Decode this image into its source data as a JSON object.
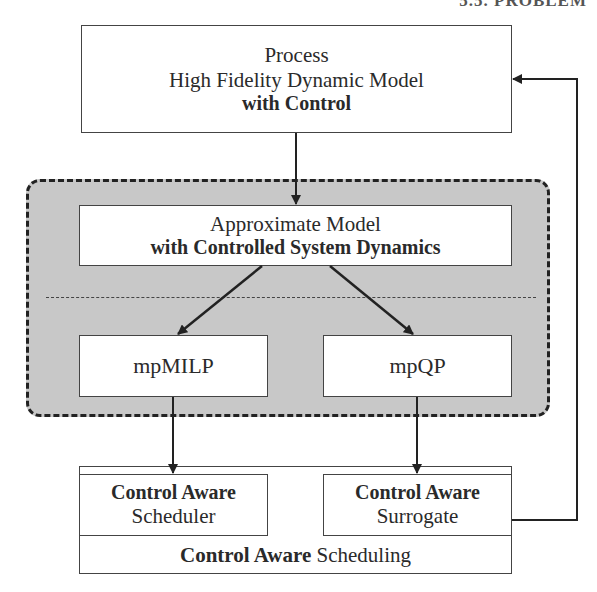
{
  "header": {
    "text": "5.5. PROBLEM"
  },
  "process_box": {
    "line1": "Process",
    "line2": "High Fidelity Dynamic Model",
    "line3": "with Control"
  },
  "approx_group": {
    "approx_box": {
      "line1": "Approximate Model",
      "line2_bold": "with Controlled System Dynamics"
    },
    "mpmilp_box": {
      "label": "mpMILP"
    },
    "mpqp_box": {
      "label": "mpQP"
    }
  },
  "scheduling_box": {
    "scheduler": {
      "bold": "Control Aware",
      "label": "Scheduler"
    },
    "surrogate": {
      "bold": "Control Aware",
      "label": "Surrogate"
    },
    "footer": {
      "bold": "Control Aware",
      "label": "Scheduling"
    }
  },
  "colors": {
    "group_fill": "#c8c8c8",
    "line": "#222222",
    "box_fill": "#ffffff"
  }
}
